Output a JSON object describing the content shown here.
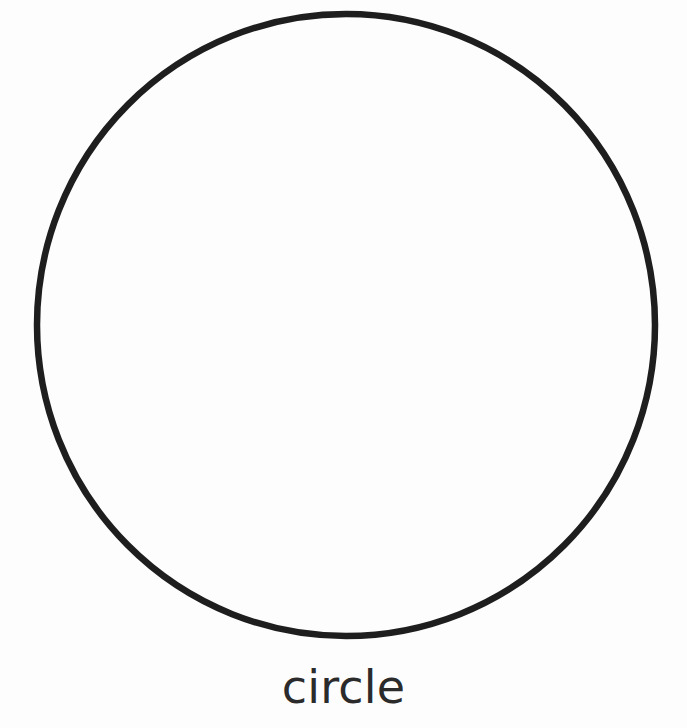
{
  "page": {
    "background_color": "#fdfdfd",
    "width": 687,
    "height": 728
  },
  "shape": {
    "name": "circle",
    "icon_name": "circle-outline-icon",
    "stroke_color": "#1e1e1e",
    "fill_color": "none",
    "stroke_width": 6.5,
    "center_x": 346,
    "center_y": 325,
    "radius_x": 309,
    "radius_y": 311
  },
  "label": {
    "text": "circle",
    "color": "#2b2b2b",
    "font_size": 46
  }
}
